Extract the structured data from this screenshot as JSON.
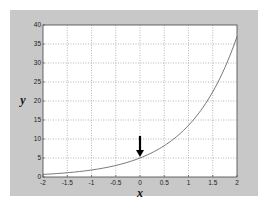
{
  "chart_data": {
    "type": "line",
    "title": "",
    "xlabel": "x",
    "ylabel": "y",
    "xlim": [
      -2,
      2
    ],
    "ylim": [
      0,
      40
    ],
    "grid": true,
    "grid_style": "dotted",
    "xticks": [
      -2,
      -1.5,
      -1,
      -0.5,
      0,
      0.5,
      1,
      1.5,
      2
    ],
    "xtick_labels": [
      "-2",
      "-1.5",
      "-1",
      "-0.5",
      "0",
      "0.5",
      "1",
      "1.5",
      "2"
    ],
    "yticks": [
      0,
      5,
      10,
      15,
      20,
      25,
      30,
      35,
      40
    ],
    "ytick_labels": [
      "0",
      "5",
      "10",
      "15",
      "20",
      "25",
      "30",
      "35",
      "40"
    ],
    "series": [
      {
        "name": "y = 5e^x",
        "x": [
          -2,
          -1.5,
          -1,
          -0.5,
          0,
          0.5,
          1,
          1.5,
          2
        ],
        "values": [
          0.68,
          1.12,
          1.84,
          3.03,
          5.0,
          8.24,
          13.59,
          22.41,
          36.95
        ],
        "color": "#555555"
      }
    ],
    "annotations": [
      {
        "type": "arrow",
        "direction": "down",
        "points_to": [
          0,
          5
        ],
        "color": "#000000"
      }
    ]
  },
  "colors": {
    "figure_background": "#c8c8c8",
    "plot_background": "#ffffff",
    "grid": "#888888",
    "curve": "#555555",
    "arrow": "#000000"
  }
}
